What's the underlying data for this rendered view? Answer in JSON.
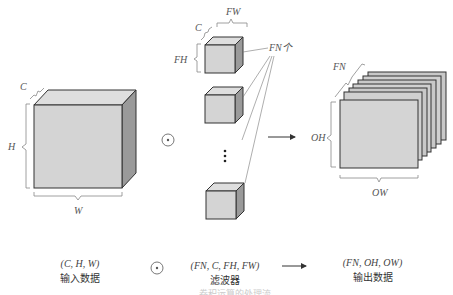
{
  "diagram": {
    "input": {
      "dims": {
        "channel": "C",
        "height": "H",
        "width": "W"
      }
    },
    "operator_symbol": "⊛",
    "filters": {
      "dims": {
        "channel": "C",
        "height": "FH",
        "width": "FW"
      },
      "count_label": "FN个",
      "ellipsis": "⋮"
    },
    "output": {
      "dims": {
        "channel": "FN",
        "height": "OH",
        "width": "OW"
      }
    }
  },
  "captions": {
    "input": {
      "shape": "(C, H, W)",
      "name": "输入数据"
    },
    "operator": "⊛",
    "filter": {
      "shape": "(FN, C, FH, FW)",
      "name": "滤波器"
    },
    "arrow": "→",
    "output": {
      "shape": "(FN, OH, OW)",
      "name": "输出数据"
    },
    "figure_caption_partial": "卷积运算的处理流"
  },
  "colors": {
    "face_front": "#d4d4d4",
    "face_top": "#dedede",
    "face_side": "#9a9a9a",
    "edge": "#333333",
    "annotation": "#777777"
  }
}
